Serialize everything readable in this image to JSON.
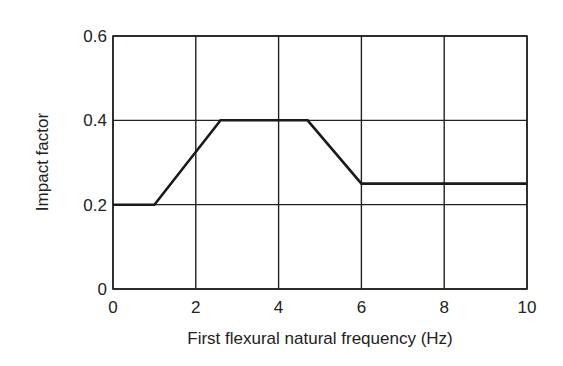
{
  "chart_data": {
    "type": "line",
    "title": "",
    "xlabel": "First flexural natural frequency (Hz)",
    "ylabel": "Impact factor",
    "xlim": [
      0,
      10
    ],
    "ylim": [
      0,
      0.6
    ],
    "grid": true,
    "x_ticks": [
      "0",
      "2",
      "4",
      "6",
      "8",
      "10"
    ],
    "y_ticks": [
      "0",
      "0.2",
      "0.4",
      "0.6"
    ],
    "series": [
      {
        "name": "Impact factor",
        "x": [
          0,
          1.0,
          2.6,
          4.7,
          6.0,
          10
        ],
        "y": [
          0.2,
          0.2,
          0.4,
          0.4,
          0.25,
          0.25
        ]
      }
    ],
    "legend": null
  }
}
